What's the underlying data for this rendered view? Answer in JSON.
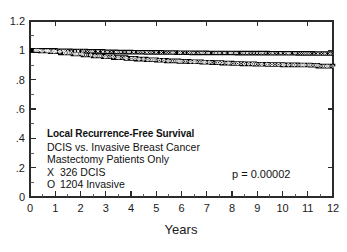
{
  "chart_data": {
    "type": "line",
    "title": "Local Recurrence-Free Survival",
    "subtitle": "DCIS vs. Invasive Breast Cancer",
    "subtitle2": "Mastectomy Patients Only",
    "xlabel": "Years",
    "ylabel": "",
    "xlim": [
      0,
      12
    ],
    "ylim": [
      0,
      1.2
    ],
    "grid": false,
    "legend_position": "inside-lower-left",
    "x_ticks": [
      "0",
      "1",
      "2",
      "3",
      "4",
      "5",
      "6",
      "7",
      "8",
      "9",
      "10",
      "11",
      "12"
    ],
    "x_tick_values": [
      0,
      1,
      2,
      3,
      4,
      5,
      6,
      7,
      8,
      9,
      10,
      11,
      12
    ],
    "y_ticks": [
      "0",
      ".2",
      ".4",
      ".6",
      ".8",
      "1",
      "1.2"
    ],
    "y_tick_values": [
      0,
      0.2,
      0.4,
      0.6,
      0.8,
      1.0,
      1.2
    ],
    "annotation": "p = 0.00002",
    "series": [
      {
        "name": "326 DCIS",
        "marker": "X",
        "n": 326,
        "x": [
          0,
          0.5,
          1.0,
          1.6,
          2.2,
          2.9,
          3.4,
          4.0,
          4.6,
          5.2,
          5.8,
          6.4,
          7.0,
          7.6,
          8.2,
          8.8,
          9.4,
          10.0,
          10.6,
          11.2,
          11.6,
          12.0
        ],
        "values": [
          1.0,
          1.0,
          0.997,
          0.995,
          0.993,
          0.99,
          0.988,
          0.987,
          0.986,
          0.985,
          0.984,
          0.983,
          0.982,
          0.982,
          0.981,
          0.981,
          0.98,
          0.98,
          0.979,
          0.978,
          0.978,
          0.978
        ]
      },
      {
        "name": "1204 Invasive",
        "marker": "O",
        "n": 1204,
        "x": [
          0,
          0.4,
          0.8,
          1.2,
          1.7,
          2.1,
          2.5,
          2.9,
          3.3,
          3.8,
          4.2,
          4.6,
          5.0,
          5.4,
          5.9,
          6.3,
          6.8,
          7.2,
          7.6,
          8.0,
          8.4,
          8.9,
          9.4,
          10.0,
          10.6,
          11.1,
          11.4,
          12.0
        ],
        "values": [
          1.0,
          0.995,
          0.99,
          0.982,
          0.975,
          0.968,
          0.962,
          0.956,
          0.95,
          0.945,
          0.94,
          0.936,
          0.932,
          0.928,
          0.925,
          0.922,
          0.919,
          0.916,
          0.913,
          0.91,
          0.908,
          0.905,
          0.903,
          0.901,
          0.9,
          0.898,
          0.892,
          0.89
        ]
      }
    ]
  },
  "axes": {
    "x_title": "Years",
    "x_tick_labels": [
      "0",
      "1",
      "2",
      "3",
      "4",
      "5",
      "6",
      "7",
      "8",
      "9",
      "10",
      "11",
      "12"
    ],
    "y_tick_labels": [
      "1.2",
      "1",
      ".8",
      ".6",
      ".4",
      ".2",
      "0"
    ]
  },
  "annotation_block": {
    "line1": "Local Recurrence-Free Survival",
    "line2": "DCIS vs. Invasive Breast Cancer",
    "line3": "Mastectomy Patients Only",
    "legend": [
      {
        "marker": "X",
        "label": "326 DCIS"
      },
      {
        "marker": "O",
        "label": "1204 Invasive"
      }
    ]
  },
  "statistics": {
    "p_value_text": "p = 0.00002"
  },
  "colors": {
    "curve": "#000000",
    "axis": "#2b2b2b",
    "text": "#111111",
    "background": "#ffffff"
  }
}
